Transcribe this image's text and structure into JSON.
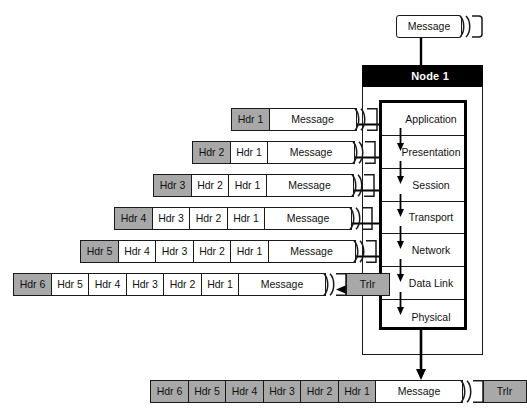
{
  "diagram": {
    "node_label": "Node 1",
    "source_message_label": "Message",
    "colors": {
      "header_fill": "#a8a8a8",
      "payload_fill": "#ffffff",
      "titlebar_fill": "#000000",
      "line": "#1a1a1a"
    }
  },
  "layers": [
    {
      "name": "Application"
    },
    {
      "name": "Presentation"
    },
    {
      "name": "Session"
    },
    {
      "name": "Transport"
    },
    {
      "name": "Network"
    },
    {
      "name": "Data Link"
    },
    {
      "name": "Physical"
    }
  ],
  "packets": [
    {
      "layer": "Application",
      "cells": [
        {
          "label": "Hdr 1",
          "fill": "gray",
          "type": "header"
        },
        {
          "label": "Message",
          "fill": "white",
          "type": "payload"
        }
      ],
      "has_tail": true,
      "trailer": null
    },
    {
      "layer": "Presentation",
      "cells": [
        {
          "label": "Hdr 2",
          "fill": "gray",
          "type": "header"
        },
        {
          "label": "Hdr 1",
          "fill": "white",
          "type": "header"
        },
        {
          "label": "Message",
          "fill": "white",
          "type": "payload"
        }
      ],
      "has_tail": true,
      "trailer": null
    },
    {
      "layer": "Session",
      "cells": [
        {
          "label": "Hdr 3",
          "fill": "gray",
          "type": "header"
        },
        {
          "label": "Hdr 2",
          "fill": "white",
          "type": "header"
        },
        {
          "label": "Hdr 1",
          "fill": "white",
          "type": "header"
        },
        {
          "label": "Message",
          "fill": "white",
          "type": "payload"
        }
      ],
      "has_tail": true,
      "trailer": null
    },
    {
      "layer": "Transport",
      "cells": [
        {
          "label": "Hdr 4",
          "fill": "gray",
          "type": "header"
        },
        {
          "label": "Hdr 3",
          "fill": "white",
          "type": "header"
        },
        {
          "label": "Hdr 2",
          "fill": "white",
          "type": "header"
        },
        {
          "label": "Hdr 1",
          "fill": "white",
          "type": "header"
        },
        {
          "label": "Message",
          "fill": "white",
          "type": "payload"
        }
      ],
      "has_tail": true,
      "trailer": null
    },
    {
      "layer": "Network",
      "cells": [
        {
          "label": "Hdr 5",
          "fill": "gray",
          "type": "header"
        },
        {
          "label": "Hdr 4",
          "fill": "white",
          "type": "header"
        },
        {
          "label": "Hdr 3",
          "fill": "white",
          "type": "header"
        },
        {
          "label": "Hdr 2",
          "fill": "white",
          "type": "header"
        },
        {
          "label": "Hdr 1",
          "fill": "white",
          "type": "header"
        },
        {
          "label": "Message",
          "fill": "white",
          "type": "payload"
        }
      ],
      "has_tail": true,
      "trailer": null
    },
    {
      "layer": "Data Link",
      "cells": [
        {
          "label": "Hdr 6",
          "fill": "gray",
          "type": "header"
        },
        {
          "label": "Hdr 5",
          "fill": "white",
          "type": "header"
        },
        {
          "label": "Hdr 4",
          "fill": "white",
          "type": "header"
        },
        {
          "label": "Hdr 3",
          "fill": "white",
          "type": "header"
        },
        {
          "label": "Hdr 2",
          "fill": "white",
          "type": "header"
        },
        {
          "label": "Hdr 1",
          "fill": "white",
          "type": "header"
        },
        {
          "label": "Message",
          "fill": "white",
          "type": "payload"
        }
      ],
      "has_tail": true,
      "trailer": {
        "label": "Trlr",
        "fill": "gray"
      }
    }
  ],
  "transmitted_frame": {
    "layer": "Physical",
    "cells": [
      {
        "label": "Hdr 6",
        "fill": "gray",
        "type": "header"
      },
      {
        "label": "Hdr 5",
        "fill": "gray",
        "type": "header"
      },
      {
        "label": "Hdr 4",
        "fill": "gray",
        "type": "header"
      },
      {
        "label": "Hdr 3",
        "fill": "gray",
        "type": "header"
      },
      {
        "label": "Hdr 2",
        "fill": "gray",
        "type": "header"
      },
      {
        "label": "Hdr 1",
        "fill": "gray",
        "type": "header"
      },
      {
        "label": "Message",
        "fill": "white",
        "type": "payload"
      }
    ],
    "has_tail": true,
    "trailer": {
      "label": "Trlr",
      "fill": "gray"
    }
  }
}
